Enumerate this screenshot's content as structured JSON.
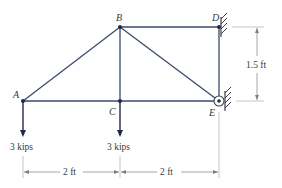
{
  "diagram": {
    "type": "truss",
    "nodes": {
      "A": {
        "label": "A"
      },
      "B": {
        "label": "B"
      },
      "C": {
        "label": "C"
      },
      "D": {
        "label": "D"
      },
      "E": {
        "label": "E"
      }
    },
    "members": [
      "AB",
      "AC",
      "BC",
      "BD",
      "BE",
      "CE",
      "DE"
    ],
    "supports": {
      "D": "wall",
      "E": "pin-wall"
    },
    "loads": [
      {
        "node": "A",
        "label": "3 kips",
        "direction": "down"
      },
      {
        "node": "C",
        "label": "3 kips",
        "direction": "down"
      }
    ],
    "dimensions": {
      "horizontal": [
        {
          "from": "A",
          "to": "C",
          "label": "2 ft"
        },
        {
          "from": "C",
          "to": "E",
          "label": "2 ft"
        }
      ],
      "vertical": [
        {
          "from": "D",
          "to": "E",
          "label": "1.5 ft"
        }
      ]
    },
    "colors": {
      "member": "#3a4a6b",
      "joint": "#1f2a44",
      "dimension": "#7a7f88",
      "text": "#333a46"
    }
  }
}
